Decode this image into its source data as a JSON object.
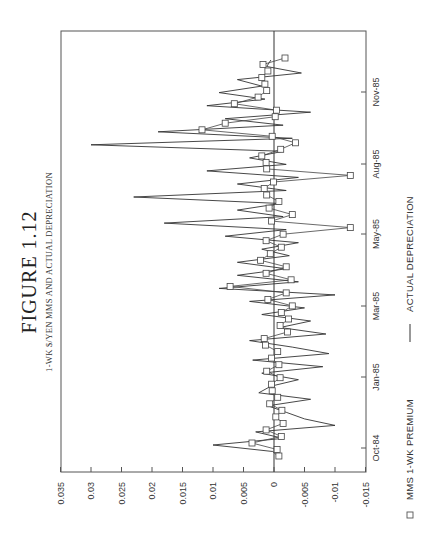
{
  "figure": {
    "title": "FIGURE 1.12",
    "subtitle": "1-WK $/YEN MMS AND ACTUAL DEPRECIATION"
  },
  "legend": {
    "items": [
      {
        "marker": "square",
        "label": "MMS 1-WK PREMIUM"
      },
      {
        "marker": "line",
        "label": "ACTUAL DEPRECIATION"
      }
    ]
  },
  "chart_data": {
    "type": "line",
    "title": "FIGURE 1.12",
    "subtitle": "1-WK $/YEN MMS AND ACTUAL DEPRECIATION",
    "orientation": "rotated 90° counter-clockwise (time axis runs bottom-to-top on page)",
    "xlabel": "",
    "ylabel": "",
    "x_tick_labels": [
      "Oct-84",
      "Jan-85",
      "Mar-85",
      "May-85",
      "Aug-85",
      "Nov-85"
    ],
    "y_tick_labels": [
      "0.035",
      "0.03",
      "0.025",
      "0.02",
      "0.015",
      "0.01",
      "0.005",
      "0",
      "-0.005",
      "-0.01",
      "-0.015"
    ],
    "ylim": [
      -0.015,
      0.035
    ],
    "grid": false,
    "legend_position": "bottom",
    "series": [
      {
        "name": "MMS 1-WK PREMIUM",
        "style": "line-with-square-markers",
        "values": [
          -0.0008,
          -0.0005,
          0.0036,
          -0.0012,
          0.0013,
          -0.0015,
          -0.0003,
          -0.0013,
          0.0007,
          -0.0006,
          0.0003,
          0.0004,
          -0.001,
          0.0012,
          -0.0008,
          0.0004,
          -0.0006,
          0.0014,
          0.0016,
          -0.0022,
          -0.001,
          -0.0024,
          -0.0012,
          -0.003,
          0.001,
          -0.002,
          0.0072,
          -0.0028,
          0.0013,
          -0.002,
          0.0022,
          0.0006,
          -0.0012,
          0.0013,
          -0.0015,
          -0.0125,
          0.0004,
          -0.003,
          0.0008,
          -0.0008,
          0.0012,
          0.0016,
          0.0001,
          -0.0125,
          0.0012,
          0.0013,
          0.002,
          -0.0011,
          -0.0035,
          0.0003,
          0.0118,
          0.008,
          -0.0002,
          -0.0004,
          0.0065,
          0.0026,
          0.0012,
          0.0015,
          0.002,
          0.001,
          0.0018,
          -0.0018
        ]
      },
      {
        "name": "ACTUAL DEPRECIATION",
        "style": "solid-line",
        "values": [
          -0.001,
          0.0002,
          0.01,
          -0.0015,
          0.003,
          -0.01,
          -0.005,
          -0.002,
          0.001,
          -0.006,
          0.0025,
          0.0005,
          -0.004,
          0.002,
          -0.008,
          0.0035,
          -0.009,
          -0.003,
          0.004,
          -0.0085,
          -0.001,
          -0.006,
          0.002,
          -0.005,
          0.004,
          -0.01,
          0.009,
          -0.004,
          0.006,
          -0.002,
          0.006,
          -0.0025,
          0.002,
          -0.004,
          0.008,
          -0.002,
          0.018,
          -0.0015,
          0.006,
          -0.001,
          0.023,
          -0.002,
          0.006,
          -0.004,
          0.011,
          -0.002,
          0.004,
          -0.0015,
          0.03,
          -0.003,
          0.019,
          -0.0015,
          0.008,
          -0.006,
          0.011,
          0.0015,
          0.009,
          0.002,
          0.006,
          -0.0045,
          0.0012,
          0.0005
        ]
      }
    ]
  }
}
